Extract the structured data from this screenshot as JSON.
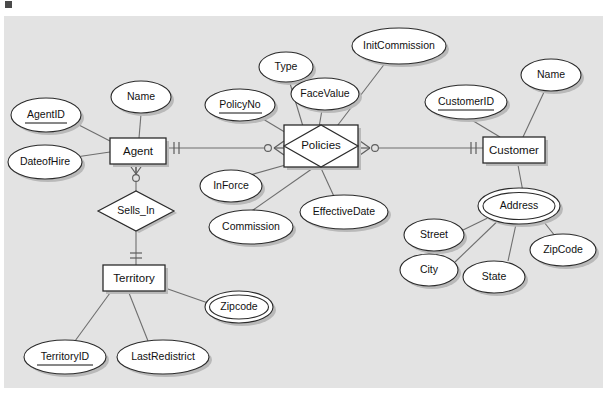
{
  "diagram": {
    "type": "entity-relationship-diagram",
    "notation": "crows-foot",
    "canvas": {
      "background_color": "#e3e3e3",
      "page_color": "#ffffff",
      "shape_fill": "#ffffff",
      "shape_stroke": "#2b2b2b",
      "line_color": "#6e6e6e",
      "shadow_color": "#b9b9b9"
    },
    "entities": [
      {
        "id": "agent",
        "label": "Agent",
        "shape": "rectangle"
      },
      {
        "id": "customer",
        "label": "Customer",
        "shape": "rectangle"
      },
      {
        "id": "territory",
        "label": "Territory",
        "shape": "rectangle"
      },
      {
        "id": "policies",
        "label": "Policies",
        "shape": "associative-entity"
      }
    ],
    "relationships": [
      {
        "id": "sells_in",
        "label": "Sells_In",
        "shape": "diamond"
      }
    ],
    "attributes": [
      {
        "id": "agentid",
        "label": "AgentID",
        "owner": "agent",
        "key": true,
        "multivalued": false
      },
      {
        "id": "agent_name",
        "label": "Name",
        "owner": "agent",
        "key": false,
        "multivalued": false
      },
      {
        "id": "dateofhire",
        "label": "DateofHire",
        "owner": "agent",
        "key": false,
        "multivalued": false
      },
      {
        "id": "policyno",
        "label": "PolicyNo",
        "owner": "policies",
        "key": true,
        "multivalued": false
      },
      {
        "id": "type",
        "label": "Type",
        "owner": "policies",
        "key": false,
        "multivalued": false
      },
      {
        "id": "facevalue",
        "label": "FaceValue",
        "owner": "policies",
        "key": false,
        "multivalued": false
      },
      {
        "id": "initcommission",
        "label": "InitCommission",
        "owner": "policies",
        "key": false,
        "multivalued": false
      },
      {
        "id": "inforce",
        "label": "InForce",
        "owner": "policies",
        "key": false,
        "multivalued": false
      },
      {
        "id": "commission",
        "label": "Commission",
        "owner": "policies",
        "key": false,
        "multivalued": false
      },
      {
        "id": "effectivedate",
        "label": "EffectiveDate",
        "owner": "policies",
        "key": false,
        "multivalued": false
      },
      {
        "id": "customerid",
        "label": "CustomerID",
        "owner": "customer",
        "key": true,
        "multivalued": false
      },
      {
        "id": "customer_name",
        "label": "Name",
        "owner": "customer",
        "key": false,
        "multivalued": false
      },
      {
        "id": "address",
        "label": "Address",
        "owner": "customer",
        "key": false,
        "multivalued": true
      },
      {
        "id": "street",
        "label": "Street",
        "owner": "address",
        "key": false,
        "multivalued": false
      },
      {
        "id": "city",
        "label": "City",
        "owner": "address",
        "key": false,
        "multivalued": false
      },
      {
        "id": "state",
        "label": "State",
        "owner": "address",
        "key": false,
        "multivalued": false
      },
      {
        "id": "zipcode_addr",
        "label": "ZipCode",
        "owner": "address",
        "key": false,
        "multivalued": false
      },
      {
        "id": "territoryid",
        "label": "TerritoryID",
        "owner": "territory",
        "key": true,
        "multivalued": false
      },
      {
        "id": "lastredistrict",
        "label": "LastRedistrict",
        "owner": "territory",
        "key": false,
        "multivalued": false
      },
      {
        "id": "zipcode_terr",
        "label": "Zipcode",
        "owner": "territory",
        "key": false,
        "multivalued": true
      }
    ],
    "connections": [
      {
        "from": "agent",
        "to": "policies",
        "from_cardinality": "one-mandatory",
        "to_cardinality": "zero-or-many"
      },
      {
        "from": "policies",
        "to": "customer",
        "from_cardinality": "zero-or-many",
        "to_cardinality": "one-mandatory"
      },
      {
        "from": "agent",
        "to": "sells_in",
        "from_cardinality": "zero-or-many",
        "to_cardinality": "none"
      },
      {
        "from": "sells_in",
        "to": "territory",
        "from_cardinality": "none",
        "to_cardinality": "one-mandatory"
      }
    ]
  }
}
